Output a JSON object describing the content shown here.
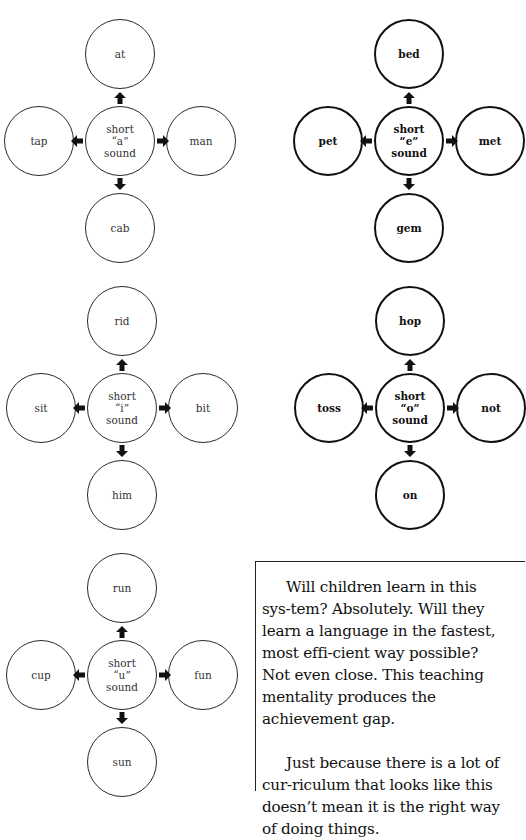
{
  "groups": [
    {
      "id": "a",
      "style": "light",
      "center": {
        "x": 120,
        "y": 141
      },
      "center_label": [
        "short",
        "“a”",
        "sound"
      ],
      "top": "at",
      "left": "tap",
      "right": "man",
      "bottom": "cab"
    },
    {
      "id": "e",
      "style": "bold",
      "center": {
        "x": 409,
        "y": 141
      },
      "center_label": [
        "short",
        "“e”",
        "sound"
      ],
      "top": "bed",
      "left": "pet",
      "right": "met",
      "bottom": "gem"
    },
    {
      "id": "i",
      "style": "light",
      "center": {
        "x": 122,
        "y": 408
      },
      "center_label": [
        "short",
        "“i”",
        "sound"
      ],
      "top": "rid",
      "left": "sit",
      "right": "bit",
      "bottom": "him"
    },
    {
      "id": "o",
      "style": "bold",
      "center": {
        "x": 410,
        "y": 408
      },
      "center_label": [
        "short",
        "“o”",
        "sound"
      ],
      "top": "hop",
      "left": "toss",
      "right": "not",
      "bottom": "on"
    },
    {
      "id": "u",
      "style": "light",
      "center": {
        "x": 122,
        "y": 675
      },
      "center_label": [
        "short",
        "“u”",
        "sound"
      ],
      "top": "run",
      "left": "cup",
      "right": "fun",
      "bottom": "sun"
    }
  ],
  "note": {
    "paragraphs": [
      "Will children learn in this sys-tem? Absolutely. Will they learn a language in the fastest, most effi-cient way possible? Not even close. This teaching mentality produces the achievement gap.",
      "Just because there is a lot of cur-riculum that looks like this doesn’t mean it is the right way of doing things."
    ]
  },
  "colors": {
    "stroke": "#2a2a2a",
    "bold_stroke": "#111111",
    "background": "#ffffff"
  }
}
